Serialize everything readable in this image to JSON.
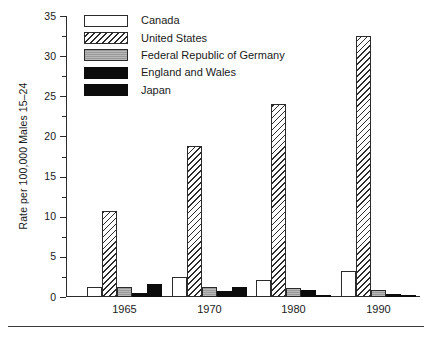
{
  "chart_data": {
    "type": "bar",
    "title": "",
    "subtitle": "",
    "xlabel": "",
    "ylabel": "Rate per 100,000 Males 15–24",
    "categories": [
      "1965",
      "1970",
      "1980",
      "1990"
    ],
    "ylim": [
      0,
      35
    ],
    "ytick_labels": [
      "0",
      "5",
      "10",
      "15",
      "20",
      "25",
      "30",
      "35"
    ],
    "ytick_values": [
      0,
      5,
      10,
      15,
      20,
      25,
      30,
      35
    ],
    "minor_tick_interval": 2.5,
    "grid": false,
    "legend_position": "top-left",
    "series": [
      {
        "name": "Canada",
        "pattern": "white-outline",
        "color": "#ffffff",
        "values": [
          1.3,
          2.5,
          2.1,
          3.3
        ]
      },
      {
        "name": "United States",
        "pattern": "diagonal-hatch",
        "color": "#ffffff",
        "values": [
          10.7,
          18.8,
          24.1,
          32.5
        ]
      },
      {
        "name": "Federal Republic of Germany",
        "pattern": "solid-gray",
        "color": "#9a9a9a",
        "values": [
          1.2,
          1.3,
          1.1,
          0.9
        ]
      },
      {
        "name": "England and Wales",
        "pattern": "solid-black",
        "color": "#0c0c0c",
        "values": [
          0.5,
          0.8,
          0.9,
          0.4
        ]
      },
      {
        "name": "Japan",
        "pattern": "solid-black",
        "color": "#0c0c0c",
        "values": [
          1.6,
          1.2,
          0.3,
          0.3
        ]
      }
    ]
  },
  "axis": {
    "line_color": "#2b2b2b"
  }
}
